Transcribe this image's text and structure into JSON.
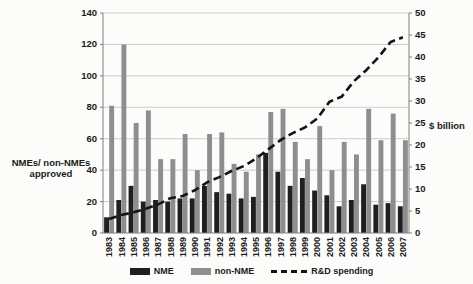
{
  "figure": {
    "left_axis_title_line1": "NMEs/ non-NMEs",
    "left_axis_title_line2": "approved",
    "right_axis_title": "$ billion"
  },
  "chart_data": {
    "type": "bar",
    "subtype": "grouped-bars-with-overlay-line",
    "categories": [
      "1983",
      "1984",
      "1985",
      "1986",
      "1987",
      "1988",
      "1989",
      "1990",
      "1991",
      "1992",
      "1993",
      "1994",
      "1995",
      "1996",
      "1997",
      "1998",
      "1999",
      "2000",
      "2001",
      "2002",
      "2003",
      "2004",
      "2005",
      "2006",
      "2007"
    ],
    "series": [
      {
        "name": "NME",
        "type": "bar",
        "axis": "left",
        "values": [
          10,
          21,
          30,
          20,
          21,
          20,
          22,
          22,
          30,
          26,
          25,
          22,
          23,
          51,
          39,
          30,
          35,
          27,
          24,
          17,
          21,
          31,
          18,
          19,
          17
        ]
      },
      {
        "name": "non-NME",
        "type": "bar",
        "axis": "left",
        "values": [
          81,
          120,
          70,
          78,
          47,
          47,
          63,
          40,
          63,
          64,
          44,
          39,
          50,
          77,
          79,
          58,
          47,
          68,
          40,
          58,
          50,
          79,
          59,
          76,
          59
        ]
      },
      {
        "name": "R&D spending",
        "type": "line",
        "style": "dashed",
        "axis": "right",
        "values": [
          3.2,
          4.1,
          4.7,
          5.5,
          6.5,
          7.9,
          8.4,
          9.7,
          11.5,
          12.7,
          14.1,
          15.2,
          16.9,
          19,
          21.1,
          22.7,
          24,
          26,
          29.8,
          31,
          34.5,
          37,
          39.9,
          43.4,
          44.5
        ]
      }
    ],
    "left_axis": {
      "label": "NMEs/ non-NMEs approved",
      "ticks": [
        0,
        20,
        40,
        60,
        80,
        100,
        120,
        140
      ],
      "min": 0,
      "max": 140
    },
    "right_axis": {
      "label": "$ billion",
      "ticks": [
        0,
        5,
        10,
        15,
        20,
        25,
        30,
        35,
        40,
        45,
        50
      ],
      "min": 0,
      "max": 50
    },
    "legend": {
      "position": "bottom",
      "entries": [
        "NME",
        "non-NME",
        "R&D spending"
      ]
    },
    "grid": true,
    "colors": {
      "nme": "#1f1f1f",
      "non_nme": "#8e8e8e",
      "line": "#141414",
      "gridline": "#b8b8b8",
      "axis": "#808080"
    }
  }
}
